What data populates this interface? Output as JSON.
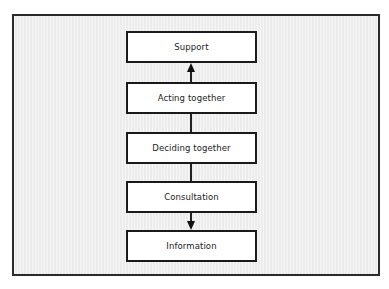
{
  "diagram": {
    "type": "flowchart",
    "orientation": "vertical",
    "nodes": [
      {
        "id": "support",
        "label": "Support"
      },
      {
        "id": "acting",
        "label": "Acting together"
      },
      {
        "id": "deciding",
        "label": "Deciding together"
      },
      {
        "id": "consultation",
        "label": "Consultation"
      },
      {
        "id": "information",
        "label": "Information"
      }
    ],
    "edges": [
      {
        "from": "acting",
        "to": "support",
        "arrow": "up"
      },
      {
        "from": "deciding",
        "to": "acting",
        "arrow": "none"
      },
      {
        "from": "deciding",
        "to": "consultation",
        "arrow": "none"
      },
      {
        "from": "consultation",
        "to": "information",
        "arrow": "down"
      }
    ],
    "colors": {
      "frame_border": "#2a2a2a",
      "frame_background": "#ececec",
      "box_border": "#1a1a1a",
      "box_fill": "#ffffff",
      "text": "#222222"
    }
  }
}
